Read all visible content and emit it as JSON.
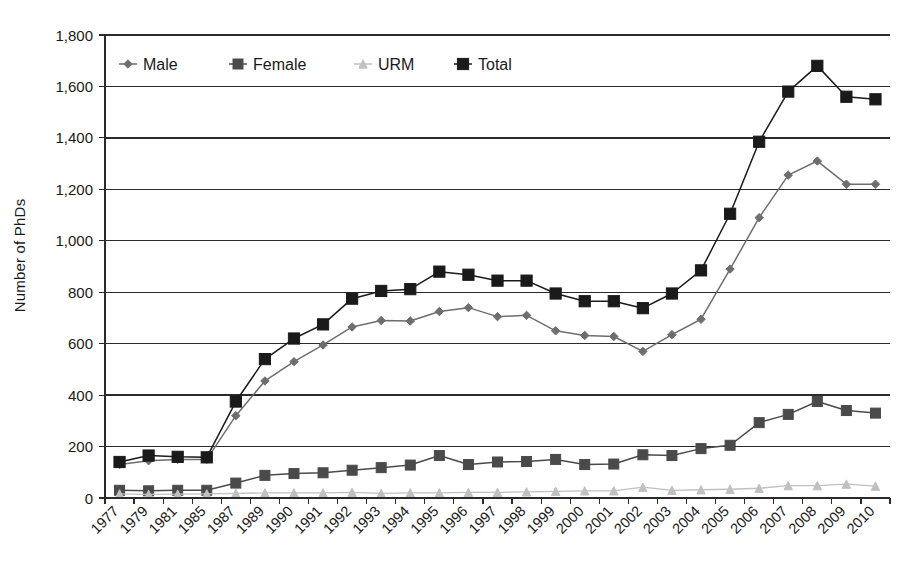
{
  "chart_data": {
    "type": "line",
    "title": "",
    "xlabel": "",
    "ylabel": "Number of PhDs",
    "ylim": [
      0,
      1800
    ],
    "ytick_step": 200,
    "grid": true,
    "legend_position": "top-left-inside",
    "categories": [
      "1977",
      "1979",
      "1981",
      "1985",
      "1987",
      "1989",
      "1990",
      "1991",
      "1992",
      "1993",
      "1994",
      "1995",
      "1996",
      "1997",
      "1998",
      "1999",
      "2000",
      "2001",
      "2002",
      "2003",
      "2004",
      "2005",
      "2006",
      "2007",
      "2008",
      "2009",
      "2010"
    ],
    "ytick_labels": [
      "0",
      "200",
      "400",
      "600",
      "800",
      "1,000",
      "1,200",
      "1,400",
      "1,600",
      "1,800"
    ],
    "series": [
      {
        "name": "Male",
        "marker": "diamond",
        "color": "#6e6e6e",
        "values": [
          130,
          145,
          150,
          150,
          320,
          455,
          530,
          595,
          665,
          690,
          688,
          725,
          740,
          705,
          710,
          650,
          632,
          628,
          570,
          635,
          695,
          890,
          1090,
          1255,
          1310,
          1220,
          1220
        ]
      },
      {
        "name": "Female",
        "marker": "square",
        "color": "#4a4a4a",
        "values": [
          30,
          28,
          30,
          30,
          58,
          88,
          95,
          98,
          108,
          118,
          128,
          165,
          130,
          140,
          142,
          150,
          130,
          132,
          168,
          165,
          192,
          205,
          293,
          325,
          375,
          340,
          330
        ]
      },
      {
        "name": "URM",
        "marker": "triangle",
        "color": "#c0c0c0",
        "values": [
          16,
          14,
          15,
          16,
          18,
          20,
          20,
          20,
          22,
          18,
          20,
          20,
          22,
          22,
          24,
          26,
          28,
          28,
          42,
          30,
          32,
          34,
          38,
          48,
          48,
          54,
          46
        ]
      },
      {
        "name": "Total",
        "marker": "square",
        "color": "#1a1a1a",
        "values": [
          140,
          165,
          160,
          158,
          375,
          540,
          620,
          675,
          775,
          805,
          812,
          880,
          868,
          845,
          845,
          795,
          765,
          765,
          738,
          795,
          885,
          1105,
          1385,
          1580,
          1680,
          1560,
          1550
        ]
      }
    ]
  },
  "legend": {
    "entries": [
      {
        "label": "Male"
      },
      {
        "label": "Female"
      },
      {
        "label": "URM"
      },
      {
        "label": "Total"
      }
    ]
  }
}
